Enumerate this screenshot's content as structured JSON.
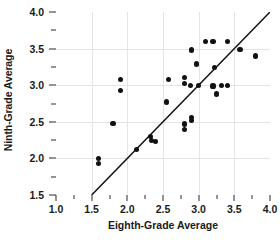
{
  "chart_data": {
    "type": "scatter",
    "title": "",
    "xlabel": "Eighth-Grade Average",
    "ylabel": "Ninth-Grade Average",
    "xlim": [
      1.0,
      4.0
    ],
    "ylim": [
      1.5,
      4.0
    ],
    "grid": true,
    "legend": null,
    "xticks": [
      {
        "value": 1.0,
        "label": "1.0",
        "major": true
      },
      {
        "value": 1.25,
        "label": "",
        "major": false
      },
      {
        "value": 1.5,
        "label": "1.5",
        "major": true
      },
      {
        "value": 1.75,
        "label": "",
        "major": false
      },
      {
        "value": 2.0,
        "label": "2.0",
        "major": true
      },
      {
        "value": 2.25,
        "label": "",
        "major": false
      },
      {
        "value": 2.5,
        "label": "2.5",
        "major": true
      },
      {
        "value": 2.75,
        "label": "",
        "major": false
      },
      {
        "value": 3.0,
        "label": "3.0",
        "major": true
      },
      {
        "value": 3.25,
        "label": "",
        "major": false
      },
      {
        "value": 3.5,
        "label": "3.5",
        "major": true
      },
      {
        "value": 3.75,
        "label": "",
        "major": false
      },
      {
        "value": 4.0,
        "label": "4.0",
        "major": true
      }
    ],
    "yticks": [
      {
        "value": 1.5,
        "label": "1.5",
        "major": true
      },
      {
        "value": 1.75,
        "label": "",
        "major": false
      },
      {
        "value": 2.0,
        "label": "2.0",
        "major": true
      },
      {
        "value": 2.25,
        "label": "",
        "major": false
      },
      {
        "value": 2.5,
        "label": "2.5",
        "major": true
      },
      {
        "value": 2.75,
        "label": "",
        "major": false
      },
      {
        "value": 3.0,
        "label": "3.0",
        "major": true
      },
      {
        "value": 3.25,
        "label": "",
        "major": false
      },
      {
        "value": 3.5,
        "label": "3.5",
        "major": true
      },
      {
        "value": 3.75,
        "label": "",
        "major": false
      },
      {
        "value": 4.0,
        "label": "4.0",
        "major": true
      }
    ],
    "gridlines_x": [
      1.5,
      2.0,
      2.5,
      3.0,
      3.5
    ],
    "gridlines_y": [
      2.0,
      2.5,
      3.0,
      3.5
    ],
    "reference_line": {
      "kind": "identity",
      "from": [
        1.5,
        1.5
      ],
      "to": [
        4.0,
        4.0
      ],
      "color": "#111111"
    },
    "point_color": "#111111",
    "points": [
      [
        1.6,
        2.0
      ],
      [
        1.6,
        1.93
      ],
      [
        1.8,
        2.48
      ],
      [
        1.9,
        3.08
      ],
      [
        1.9,
        2.93
      ],
      [
        2.13,
        2.12
      ],
      [
        2.33,
        2.3
      ],
      [
        2.34,
        2.25
      ],
      [
        2.4,
        2.23
      ],
      [
        2.55,
        2.77
      ],
      [
        2.58,
        3.08
      ],
      [
        2.8,
        3.1
      ],
      [
        2.8,
        3.02
      ],
      [
        2.8,
        2.47
      ],
      [
        2.8,
        2.4
      ],
      [
        2.88,
        3.0
      ],
      [
        2.9,
        3.48
      ],
      [
        2.9,
        2.56
      ],
      [
        2.9,
        2.52
      ],
      [
        2.97,
        3.29
      ],
      [
        3.0,
        3.0
      ],
      [
        3.1,
        3.6
      ],
      [
        3.2,
        3.6
      ],
      [
        3.2,
        2.99
      ],
      [
        3.22,
        3.24
      ],
      [
        3.25,
        2.88
      ],
      [
        3.32,
        3.0
      ],
      [
        3.4,
        3.6
      ],
      [
        3.4,
        3.0
      ],
      [
        3.58,
        3.49
      ],
      [
        3.8,
        3.4
      ]
    ]
  }
}
